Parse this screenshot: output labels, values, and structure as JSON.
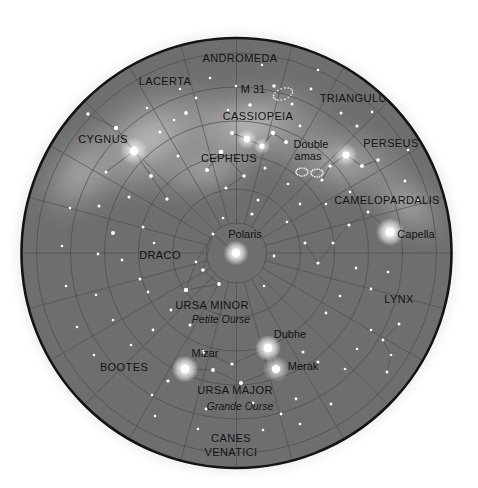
{
  "chart": {
    "type": "skymap",
    "projection": "polar",
    "center_star": "Polaris",
    "disc": {
      "cx": 236.5,
      "cy": 253,
      "r": 215,
      "fill": "#6e6e6e",
      "rim": "#141414"
    },
    "background": "#ffffff",
    "grid": {
      "declination_circles_r": [
        30,
        64,
        98,
        132,
        166,
        200
      ],
      "radial_lines_count": 24,
      "grid_color": "#4d4d4d"
    },
    "milkyway_color": "#a8a8a8"
  },
  "constellations": [
    {
      "name": "ANDROMEDA",
      "x": 240,
      "y": 62,
      "size": "normal"
    },
    {
      "name": "LACERTA",
      "x": 165,
      "y": 85,
      "size": "normal"
    },
    {
      "name": "TRIANGULUM",
      "x": 358,
      "y": 102,
      "size": "normal"
    },
    {
      "name": "CASSIOPEIA",
      "x": 258,
      "y": 120,
      "size": "normal"
    },
    {
      "name": "CYGNUS",
      "x": 103,
      "y": 143,
      "size": "normal"
    },
    {
      "name": "PERSEUS",
      "x": 391,
      "y": 147,
      "size": "normal"
    },
    {
      "name": "CEPHEUS",
      "x": 229,
      "y": 162,
      "size": "normal"
    },
    {
      "name": "CAMELOPARDALIS",
      "x": 387,
      "y": 204,
      "size": "normal"
    },
    {
      "name": "DRACO",
      "x": 160,
      "y": 259,
      "size": "normal"
    },
    {
      "name": "URSA MINOR",
      "x": 212,
      "y": 309,
      "size": "normal"
    },
    {
      "name": "LYNX",
      "x": 399,
      "y": 303,
      "size": "normal"
    },
    {
      "name": "BOOTES",
      "x": 124,
      "y": 371,
      "size": "normal"
    },
    {
      "name": "URSA MAJOR",
      "x": 235,
      "y": 394,
      "size": "normal"
    },
    {
      "name": "CANES",
      "x": 231,
      "y": 442,
      "size": "normal"
    },
    {
      "name": "VENATICI",
      "x": 231,
      "y": 456,
      "size": "normal"
    }
  ],
  "french_names": [
    {
      "name": "Petite Ourse",
      "x": 221,
      "y": 323
    },
    {
      "name": "Grande Ourse",
      "x": 240,
      "y": 410
    }
  ],
  "named_stars": [
    {
      "name": "Polaris",
      "x": 245,
      "y": 238,
      "sx": 236,
      "sy": 253,
      "mag": 2.0
    },
    {
      "name": "Capella",
      "x": 416,
      "y": 238,
      "sx": 390,
      "sy": 232,
      "mag": 0.1
    },
    {
      "name": "Dubhe",
      "x": 290,
      "y": 338,
      "sx": 268,
      "sy": 348,
      "mag": 1.8
    },
    {
      "name": "Merak",
      "x": 303,
      "y": 370,
      "sx": 276,
      "sy": 369,
      "mag": 2.4
    },
    {
      "name": "Mizar",
      "x": 205,
      "y": 357,
      "sx": 185,
      "sy": 369,
      "mag": 2.2
    }
  ],
  "deep_sky_objects": [
    {
      "name": "M 31",
      "label_x": 253,
      "label_y": 93,
      "mark_x": 283,
      "mark_y": 94,
      "kind": "galaxy"
    },
    {
      "name": "Double",
      "label_x": 311,
      "label_y": 148,
      "kind": "cluster-text"
    },
    {
      "name": "amas",
      "label_x": 308,
      "label_y": 160,
      "mark_x": 309,
      "mark_y": 172,
      "kind": "cluster"
    }
  ],
  "stars": [
    {
      "x": 236,
      "y": 253,
      "r": 3.6
    },
    {
      "x": 213,
      "y": 234,
      "r": 1.5
    },
    {
      "x": 252,
      "y": 214,
      "r": 1.6
    },
    {
      "x": 203,
      "y": 270,
      "r": 1.8
    },
    {
      "x": 219,
      "y": 284,
      "r": 1.9
    },
    {
      "x": 186,
      "y": 290,
      "r": 2.2
    },
    {
      "x": 196,
      "y": 262,
      "r": 1.4
    },
    {
      "x": 258,
      "y": 200,
      "r": 1.5
    },
    {
      "x": 274,
      "y": 256,
      "r": 1.4
    },
    {
      "x": 223,
      "y": 218,
      "r": 1.3
    },
    {
      "x": 264,
      "y": 286,
      "r": 1.3
    },
    {
      "x": 185,
      "y": 369,
      "r": 4.2
    },
    {
      "x": 203,
      "y": 352,
      "r": 2.0
    },
    {
      "x": 213,
      "y": 370,
      "r": 1.9
    },
    {
      "x": 268,
      "y": 348,
      "r": 4.0
    },
    {
      "x": 276,
      "y": 369,
      "r": 2.3
    },
    {
      "x": 241,
      "y": 383,
      "r": 2.0
    },
    {
      "x": 232,
      "y": 364,
      "r": 1.6
    },
    {
      "x": 168,
      "y": 381,
      "r": 1.6
    },
    {
      "x": 253,
      "y": 403,
      "r": 1.5
    },
    {
      "x": 296,
      "y": 399,
      "r": 1.4
    },
    {
      "x": 281,
      "y": 414,
      "r": 1.4
    },
    {
      "x": 206,
      "y": 409,
      "r": 1.4
    },
    {
      "x": 303,
      "y": 352,
      "r": 1.5
    },
    {
      "x": 318,
      "y": 362,
      "r": 1.5
    },
    {
      "x": 152,
      "y": 395,
      "r": 1.3
    },
    {
      "x": 134,
      "y": 151,
      "r": 4.4
    },
    {
      "x": 116,
      "y": 128,
      "r": 2.2
    },
    {
      "x": 151,
      "y": 176,
      "r": 1.9
    },
    {
      "x": 106,
      "y": 172,
      "r": 1.5
    },
    {
      "x": 167,
      "y": 199,
      "r": 1.7
    },
    {
      "x": 129,
      "y": 197,
      "r": 1.5
    },
    {
      "x": 99,
      "y": 206,
      "r": 1.5
    },
    {
      "x": 113,
      "y": 233,
      "r": 2.0
    },
    {
      "x": 143,
      "y": 227,
      "r": 1.5
    },
    {
      "x": 88,
      "y": 114,
      "r": 1.7
    },
    {
      "x": 160,
      "y": 132,
      "r": 1.6
    },
    {
      "x": 186,
      "y": 113,
      "r": 1.9
    },
    {
      "x": 178,
      "y": 156,
      "r": 1.5
    },
    {
      "x": 122,
      "y": 260,
      "r": 1.4
    },
    {
      "x": 140,
      "y": 279,
      "r": 1.5
    },
    {
      "x": 98,
      "y": 254,
      "r": 1.4
    },
    {
      "x": 154,
      "y": 243,
      "r": 1.3
    },
    {
      "x": 247,
      "y": 139,
      "r": 3.2
    },
    {
      "x": 262,
      "y": 146,
      "r": 2.6
    },
    {
      "x": 273,
      "y": 133,
      "r": 2.2
    },
    {
      "x": 286,
      "y": 142,
      "r": 2.0
    },
    {
      "x": 232,
      "y": 133,
      "r": 2.0
    },
    {
      "x": 221,
      "y": 152,
      "r": 2.3
    },
    {
      "x": 207,
      "y": 170,
      "r": 2.0
    },
    {
      "x": 244,
      "y": 176,
      "r": 1.8
    },
    {
      "x": 226,
      "y": 188,
      "r": 1.6
    },
    {
      "x": 265,
      "y": 168,
      "r": 1.5
    },
    {
      "x": 250,
      "y": 105,
      "r": 1.8
    },
    {
      "x": 274,
      "y": 86,
      "r": 1.7
    },
    {
      "x": 292,
      "y": 104,
      "r": 1.5
    },
    {
      "x": 311,
      "y": 89,
      "r": 1.4
    },
    {
      "x": 236,
      "y": 86,
      "r": 1.3
    },
    {
      "x": 346,
      "y": 155,
      "r": 3.6
    },
    {
      "x": 362,
      "y": 166,
      "r": 2.0
    },
    {
      "x": 378,
      "y": 160,
      "r": 1.8
    },
    {
      "x": 330,
      "y": 166,
      "r": 1.7
    },
    {
      "x": 322,
      "y": 180,
      "r": 1.6
    },
    {
      "x": 357,
      "y": 126,
      "r": 1.6
    },
    {
      "x": 341,
      "y": 113,
      "r": 1.5
    },
    {
      "x": 372,
      "y": 112,
      "r": 1.4
    },
    {
      "x": 390,
      "y": 232,
      "r": 4.6
    },
    {
      "x": 368,
      "y": 212,
      "r": 1.5
    },
    {
      "x": 349,
      "y": 225,
      "r": 1.6
    },
    {
      "x": 333,
      "y": 243,
      "r": 1.5
    },
    {
      "x": 318,
      "y": 263,
      "r": 1.6
    },
    {
      "x": 305,
      "y": 243,
      "r": 1.5
    },
    {
      "x": 356,
      "y": 268,
      "r": 1.4
    },
    {
      "x": 371,
      "y": 289,
      "r": 1.4
    },
    {
      "x": 388,
      "y": 272,
      "r": 1.3
    },
    {
      "x": 399,
      "y": 324,
      "r": 1.5
    },
    {
      "x": 383,
      "y": 340,
      "r": 1.4
    },
    {
      "x": 391,
      "y": 355,
      "r": 1.3
    },
    {
      "x": 387,
      "y": 372,
      "r": 1.4
    },
    {
      "x": 371,
      "y": 330,
      "r": 1.3
    },
    {
      "x": 357,
      "y": 349,
      "r": 1.3
    },
    {
      "x": 345,
      "y": 369,
      "r": 1.3
    },
    {
      "x": 405,
      "y": 181,
      "r": 1.4
    },
    {
      "x": 418,
      "y": 200,
      "r": 1.3
    },
    {
      "x": 300,
      "y": 204,
      "r": 1.4
    },
    {
      "x": 287,
      "y": 222,
      "r": 1.3
    },
    {
      "x": 196,
      "y": 98,
      "r": 1.4
    },
    {
      "x": 174,
      "y": 120,
      "r": 1.3
    },
    {
      "x": 210,
      "y": 78,
      "r": 1.3
    },
    {
      "x": 300,
      "y": 126,
      "r": 1.4
    },
    {
      "x": 326,
      "y": 204,
      "r": 1.3
    },
    {
      "x": 153,
      "y": 330,
      "r": 1.4
    },
    {
      "x": 131,
      "y": 345,
      "r": 1.3
    },
    {
      "x": 113,
      "y": 320,
      "r": 1.3
    },
    {
      "x": 96,
      "y": 295,
      "r": 1.3
    },
    {
      "x": 171,
      "y": 310,
      "r": 1.4
    },
    {
      "x": 190,
      "y": 325,
      "r": 1.5
    },
    {
      "x": 148,
      "y": 292,
      "r": 1.4
    },
    {
      "x": 326,
      "y": 313,
      "r": 1.4
    },
    {
      "x": 340,
      "y": 296,
      "r": 1.3
    },
    {
      "x": 263,
      "y": 430,
      "r": 1.3
    },
    {
      "x": 198,
      "y": 429,
      "r": 1.3
    },
    {
      "x": 300,
      "y": 424,
      "r": 1.3
    },
    {
      "x": 155,
      "y": 416,
      "r": 1.3
    },
    {
      "x": 331,
      "y": 404,
      "r": 1.4
    },
    {
      "x": 94,
      "y": 355,
      "r": 1.3
    },
    {
      "x": 77,
      "y": 327,
      "r": 1.3
    },
    {
      "x": 66,
      "y": 286,
      "r": 1.3
    },
    {
      "x": 62,
      "y": 246,
      "r": 1.3
    },
    {
      "x": 70,
      "y": 208,
      "r": 1.3
    },
    {
      "x": 408,
      "y": 150,
      "r": 1.3
    },
    {
      "x": 318,
      "y": 70,
      "r": 1.3
    },
    {
      "x": 262,
      "y": 65,
      "r": 1.2
    },
    {
      "x": 180,
      "y": 89,
      "r": 1.2
    },
    {
      "x": 147,
      "y": 108,
      "r": 1.2
    },
    {
      "x": 228,
      "y": 110,
      "r": 1.3
    },
    {
      "x": 288,
      "y": 184,
      "r": 1.3
    },
    {
      "x": 350,
      "y": 192,
      "r": 1.3
    }
  ],
  "constellation_lines": [
    [
      [
        236,
        253
      ],
      [
        213,
        234
      ]
    ],
    [
      [
        213,
        234
      ],
      [
        203,
        270
      ]
    ],
    [
      [
        203,
        270
      ],
      [
        219,
        284
      ]
    ],
    [
      [
        219,
        284
      ],
      [
        186,
        290
      ]
    ],
    [
      [
        186,
        290
      ],
      [
        196,
        262
      ]
    ],
    [
      [
        196,
        262
      ],
      [
        213,
        234
      ]
    ],
    [
      [
        185,
        369
      ],
      [
        203,
        352
      ]
    ],
    [
      [
        185,
        369
      ],
      [
        213,
        370
      ]
    ],
    [
      [
        213,
        370
      ],
      [
        241,
        383
      ]
    ],
    [
      [
        241,
        383
      ],
      [
        276,
        369
      ]
    ],
    [
      [
        276,
        369
      ],
      [
        268,
        348
      ]
    ],
    [
      [
        268,
        348
      ],
      [
        232,
        364
      ]
    ],
    [
      [
        232,
        364
      ],
      [
        203,
        352
      ]
    ],
    [
      [
        134,
        151
      ],
      [
        116,
        128
      ]
    ],
    [
      [
        134,
        151
      ],
      [
        151,
        176
      ]
    ],
    [
      [
        151,
        176
      ],
      [
        167,
        199
      ]
    ],
    [
      [
        134,
        151
      ],
      [
        106,
        172
      ]
    ],
    [
      [
        116,
        128
      ],
      [
        88,
        114
      ]
    ],
    [
      [
        247,
        139
      ],
      [
        262,
        146
      ]
    ],
    [
      [
        262,
        146
      ],
      [
        273,
        133
      ]
    ],
    [
      [
        273,
        133
      ],
      [
        286,
        142
      ]
    ],
    [
      [
        247,
        139
      ],
      [
        232,
        133
      ]
    ],
    [
      [
        221,
        152
      ],
      [
        207,
        170
      ]
    ],
    [
      [
        221,
        152
      ],
      [
        244,
        176
      ]
    ],
    [
      [
        244,
        176
      ],
      [
        226,
        188
      ]
    ],
    [
      [
        346,
        155
      ],
      [
        362,
        166
      ]
    ],
    [
      [
        362,
        166
      ],
      [
        378,
        160
      ]
    ],
    [
      [
        346,
        155
      ],
      [
        330,
        166
      ]
    ],
    [
      [
        330,
        166
      ],
      [
        322,
        180
      ]
    ],
    [
      [
        390,
        232
      ],
      [
        368,
        212
      ]
    ],
    [
      [
        368,
        212
      ],
      [
        349,
        225
      ]
    ],
    [
      [
        349,
        225
      ],
      [
        333,
        243
      ]
    ],
    [
      [
        333,
        243
      ],
      [
        318,
        263
      ]
    ],
    [
      [
        318,
        263
      ],
      [
        305,
        243
      ]
    ],
    [
      [
        399,
        324
      ],
      [
        383,
        340
      ]
    ],
    [
      [
        383,
        340
      ],
      [
        391,
        355
      ]
    ],
    [
      [
        391,
        355
      ],
      [
        387,
        372
      ]
    ]
  ]
}
